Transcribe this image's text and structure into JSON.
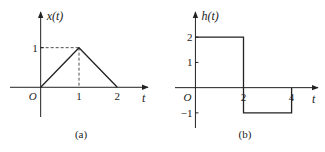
{
  "chart_data": [
    {
      "type": "line",
      "panel_label": "(a)",
      "ylabel": "x(t)",
      "xlabel": "t",
      "origin_label": "O",
      "x": [
        0,
        1,
        2
      ],
      "y": [
        0,
        1,
        0
      ],
      "xticks": [
        1,
        2
      ],
      "xtick_labels": [
        "1",
        "2"
      ],
      "yticks": [
        1
      ],
      "ytick_labels": [
        "1"
      ],
      "xlim": [
        -0.8,
        2.8
      ],
      "ylim": [
        -0.75,
        1.9
      ],
      "guides": [
        {
          "x": 1,
          "y": 1,
          "style": "dashed"
        }
      ]
    },
    {
      "type": "line",
      "panel_label": "(b)",
      "ylabel": "h(t)",
      "xlabel": "t",
      "origin_label": "O",
      "x": [
        0,
        2,
        2,
        4,
        4
      ],
      "y": [
        2,
        2,
        -1,
        -1,
        0
      ],
      "xticks": [
        2,
        4
      ],
      "xtick_labels": [
        "2",
        "4"
      ],
      "yticks": [
        2,
        1,
        -1
      ],
      "ytick_labels": [
        "2",
        "1",
        "−1"
      ],
      "xlim": [
        -0.85,
        5.1
      ],
      "ylim": [
        -1.6,
        3.0
      ]
    }
  ]
}
